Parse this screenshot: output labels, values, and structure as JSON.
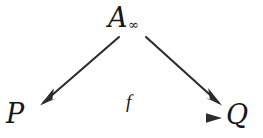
{
  "diagram": {
    "kind": "commutative-triangle",
    "background_color": "#ffffff",
    "ink_color": "#2a2a2e",
    "nodes": [
      {
        "id": "a-infinity",
        "label": "A",
        "subscript": "∞",
        "full_text": "A∞",
        "role": "apex",
        "x": 130,
        "y": 20
      },
      {
        "id": "p",
        "label": "P",
        "subscript": "",
        "full_text": "P",
        "role": "source",
        "x": 20,
        "y": 117
      },
      {
        "id": "q",
        "label": "Q",
        "subscript": "",
        "full_text": "Q",
        "role": "target",
        "x": 241,
        "y": 118
      }
    ],
    "edges": [
      {
        "id": "edge-a-to-p",
        "from": "a-infinity",
        "to": "p",
        "label": "",
        "arrowhead": "barbed",
        "x1": 119,
        "y1": 37,
        "x2": 40,
        "y2": 105
      },
      {
        "id": "edge-a-to-q",
        "from": "a-infinity",
        "to": "q",
        "label": "",
        "arrowhead": "barbed",
        "x1": 145,
        "y1": 37,
        "x2": 222,
        "y2": 105
      },
      {
        "id": "edge-p-to-q",
        "from": "p",
        "to": "q",
        "label": "f",
        "arrowhead": "solid-triangle",
        "x1": 40,
        "y1": 118,
        "x2": 221,
        "y2": 118
      }
    ]
  }
}
